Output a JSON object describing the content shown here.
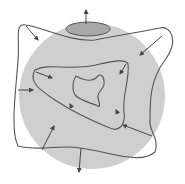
{
  "diagram": {
    "type": "nested-boundary-schematic",
    "colors": {
      "background": "#ffffff",
      "sphere_fill": "#cfcfcf",
      "cap_fill": "#a8a8a8",
      "line": "#555555",
      "arrow": "#444444"
    },
    "elements": {
      "sphere": {
        "cx": 92,
        "cy": 96,
        "r": 73
      },
      "top_cap": {
        "cx": 88,
        "cy": 29,
        "rx": 22,
        "ry": 7
      },
      "outer_loop": "M 26 25 C 14 22 20 40 18 60 C 16 90 10 130 18 146 C 40 152 60 144 80 148 C 110 152 140 165 155 152 C 160 138 148 130 150 120 C 150 100 150 80 165 60 C 180 40 170 25 160 28 C 140 32 120 35 95 40 C 70 42 45 28 26 25 Z",
      "middle_loop": "M 35 70 C 50 62 70 72 100 64 C 110 62 126 58 128 64 C 130 78 122 96 124 112 C 126 126 118 132 110 128 C 90 120 70 110 55 100 C 40 90 28 82 35 70 Z",
      "inner_loop": "M 76 76 C 82 80 92 82 96 78 C 100 72 104 76 104 82 C 106 88 96 92 98 98 C 100 104 100 108 98 106 C 88 102 80 100 76 96 C 72 92 72 82 76 76 Z",
      "inward_arrows": [
        {
          "from": [
            26,
            26
          ],
          "to": [
            38,
            40
          ]
        },
        {
          "from": [
            162,
            36
          ],
          "to": [
            140,
            55
          ]
        },
        {
          "from": [
            36,
            72
          ],
          "to": [
            52,
            78
          ]
        },
        {
          "from": [
            126,
            64
          ],
          "to": [
            120,
            74
          ]
        },
        {
          "from": [
            18,
            90
          ],
          "to": [
            33,
            90
          ]
        },
        {
          "from": [
            72,
            108
          ],
          "to": [
            70,
            104
          ]
        },
        {
          "from": [
            118,
            114
          ],
          "to": [
            116,
            110
          ]
        },
        {
          "from": [
            152,
            136
          ],
          "to": [
            123,
            125
          ]
        },
        {
          "from": [
            42,
            150
          ],
          "to": [
            54,
            126
          ]
        }
      ],
      "outward_arrows": [
        {
          "from": [
            86,
            24
          ],
          "to": [
            86,
            10
          ]
        },
        {
          "from": [
            81,
            148
          ],
          "to": [
            79,
            172
          ]
        }
      ]
    }
  }
}
